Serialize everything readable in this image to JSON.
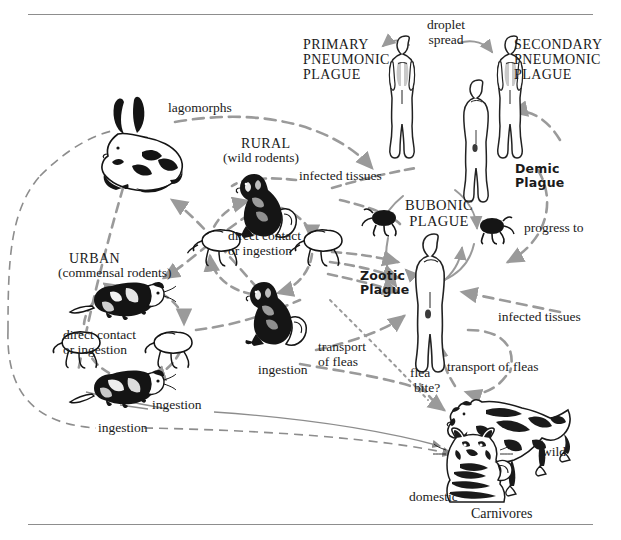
{
  "figure": {
    "type": "diagram",
    "rules": {
      "top": true,
      "bottom": true
    }
  },
  "labels": {
    "droplet_spread": "droplet\nspread",
    "primary_pneumonic": "PRIMARY\nPNEUMONIC\nPLAGUE",
    "secondary_pneumonic": "SECONDARY\nPNEUMONIC\nPLAGUE",
    "bubonic": "BUBONIC\nPLAGUE",
    "demic_plague": "Demic\nPlague",
    "zootic_plague": "Zootic\nPlague",
    "progress_to": "progress to",
    "infected_tissues_right": "infected tissues",
    "infected_tissues_rural": "infected tissues",
    "lagomorphs": "lagomorphs",
    "rural": "RURAL",
    "rural_sub": "(wild rodents)",
    "urban": "URBAN",
    "urban_sub": "(commensal rodents)",
    "direct_contact_rural": "direct contact\nor ingestion",
    "direct_contact_urban": "direct contact\nor ingestion",
    "ingestion_mid": "ingestion",
    "ingestion_upper": "ingestion",
    "ingestion_lower": "ingestion",
    "transport_of_fleas_left": "transport\nof fleas",
    "transport_of_fleas_right": "transport of fleas",
    "flea_bite": "flea\nbite?",
    "domestic": "domestic",
    "wild": "wild",
    "carnivores": "Carnivores"
  },
  "lines": {
    "droplet_spread_1": "droplet",
    "droplet_spread_2": "spread",
    "primary_1": "PRIMARY",
    "primary_2": "PNEUMONIC",
    "primary_3": "PLAGUE",
    "secondary_1": "SECONDARY",
    "secondary_2": "PNEUMONIC",
    "secondary_3": "PLAGUE",
    "bubonic_1": "BUBONIC",
    "bubonic_2": "PLAGUE",
    "demic_1": "Demic",
    "demic_2": "Plague",
    "zootic_1": "Zootic",
    "zootic_2": "Plague",
    "dc_rural_1": "direct contact",
    "dc_rural_2": "or ingestion",
    "dc_urban_1": "direct contact",
    "dc_urban_2": "or ingestion",
    "tof_left_1": "transport",
    "tof_left_2": "of fleas",
    "flea_1": "flea",
    "flea_2": "bite?"
  },
  "icons": {
    "rabbit": "rabbit-icon",
    "squirrel_upper": "ground-squirrel-icon",
    "squirrel_lower": "ground-squirrel-icon",
    "rat_upper": "rat-icon",
    "rat_lower": "rat-icon",
    "flea_rural_left": "flea-icon",
    "flea_rural_right": "flea-icon",
    "flea_urban_left": "flea-icon",
    "flea_urban_right": "flea-icon",
    "flea_bubonic_left": "flea-icon",
    "flea_bubonic_right": "flea-icon",
    "human_primary": "human-figure-icon",
    "human_center": "human-figure-icon",
    "human_secondary": "human-figure-icon",
    "human_bubonic": "human-figure-icon",
    "cat": "domestic-cat-icon",
    "wolf": "wild-canid-icon"
  },
  "colors": {
    "ink": "#1a1a1a",
    "arrow_gray": "#9a9a9a",
    "thin_gray": "#8d8d8d",
    "lung_fill": "#c9c9c9",
    "page_bg": "#ffffff"
  }
}
